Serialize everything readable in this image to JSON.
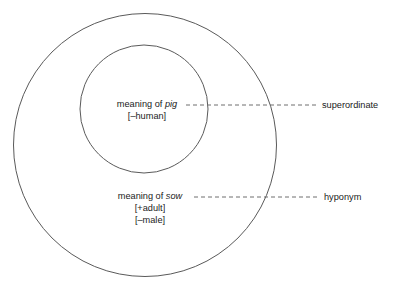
{
  "diagram": {
    "background_color": "#ffffff",
    "stroke_color": "#555555",
    "text_color": "#1a1a1a",
    "outer_circle": {
      "name": "outer-circle",
      "cx": 145,
      "cy": 145,
      "r": 131.5
    },
    "inner_circle": {
      "name": "inner-circle",
      "cx": 144,
      "cy": 109,
      "r": 64
    },
    "inner_label": {
      "prefix": "meaning of ",
      "word": "pig",
      "feature_1": "[–human]"
    },
    "outer_label": {
      "prefix": "meaning of ",
      "word": "sow",
      "feature_1": "[+adult]",
      "feature_2": "[–male]"
    },
    "callouts": [
      {
        "id": "superordinate",
        "label": "superordinate",
        "line_y": 105,
        "line_x1": 186,
        "line_x2": 317,
        "label_x": 322
      },
      {
        "id": "hyponym",
        "label": "hyponym",
        "line_y": 197,
        "line_x1": 194,
        "line_x2": 319,
        "label_x": 324
      }
    ]
  }
}
